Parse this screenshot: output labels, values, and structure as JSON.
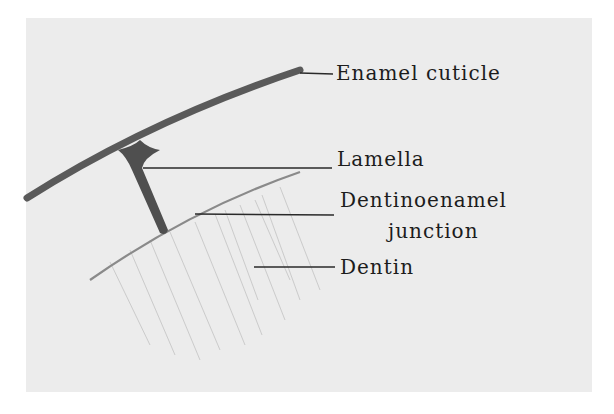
{
  "figure": {
    "labels": {
      "enamel_cuticle": "Enamel cuticle",
      "lamella": "Lamella",
      "dej_line1": "Dentinoenamel",
      "dej_line2": "junction",
      "dentin": "Dentin"
    },
    "colors": {
      "background": "#ececec",
      "cuticle": "#5a5a5a",
      "leader": "#2a2a2a",
      "junction": "#8a8a8a",
      "text": "#1c1c1c"
    }
  }
}
